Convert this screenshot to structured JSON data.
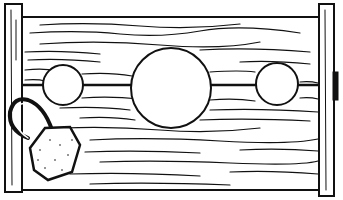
{
  "illustration": {
    "subject": "Wooden pillory stocks with padlock",
    "colors": {
      "ink": "#111111",
      "paper": "#ffffff"
    },
    "elements": [
      "left-post",
      "right-post",
      "plank",
      "small-hole-left",
      "large-hole-center",
      "small-hole-right",
      "padlock",
      "hinge"
    ]
  }
}
